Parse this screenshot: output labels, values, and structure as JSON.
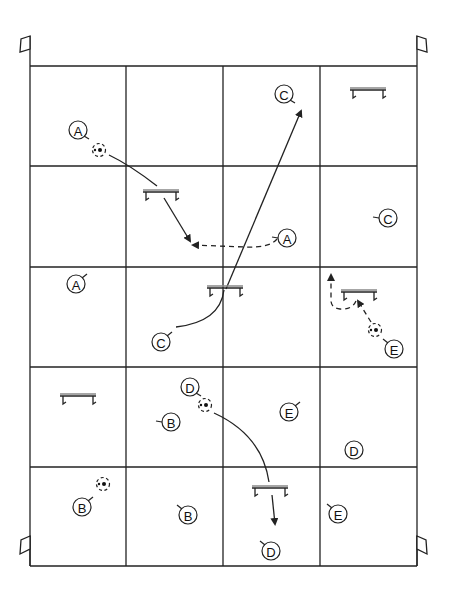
{
  "diagram": {
    "type": "soccer-drill-field",
    "grid": {
      "left": 30,
      "top": 66,
      "right": 417,
      "bottom": 566,
      "cols": [
        30,
        126,
        223,
        320,
        417
      ],
      "rows": [
        66,
        166,
        267,
        367,
        467,
        566
      ]
    },
    "colors": {
      "line": "#222222",
      "background": "#ffffff"
    },
    "flags": [
      {
        "id": "flag-top-left",
        "x": 30,
        "y": 66,
        "side": "left",
        "pos": "top"
      },
      {
        "id": "flag-top-right",
        "x": 417,
        "y": 66,
        "side": "right",
        "pos": "top"
      },
      {
        "id": "flag-bottom-left",
        "x": 30,
        "y": 566,
        "side": "left",
        "pos": "bottom"
      },
      {
        "id": "flag-bottom-right",
        "x": 417,
        "y": 566,
        "side": "right",
        "pos": "bottom"
      }
    ],
    "players": [
      {
        "label": "A",
        "x": 78,
        "y": 130,
        "tick": "se"
      },
      {
        "label": "A",
        "x": 287,
        "y": 238,
        "tick": "w"
      },
      {
        "label": "A",
        "x": 76,
        "y": 284,
        "tick": "ne"
      },
      {
        "label": "C",
        "x": 284,
        "y": 94,
        "tick": "se"
      },
      {
        "label": "C",
        "x": 388,
        "y": 218,
        "tick": "w"
      },
      {
        "label": "C",
        "x": 161,
        "y": 342,
        "tick": "ne"
      },
      {
        "label": "D",
        "x": 190,
        "y": 387,
        "tick": "se"
      },
      {
        "label": "D",
        "x": 354,
        "y": 450,
        "tick": "none"
      },
      {
        "label": "D",
        "x": 271,
        "y": 551,
        "tick": "nw"
      },
      {
        "label": "B",
        "x": 171,
        "y": 422,
        "tick": "w"
      },
      {
        "label": "B",
        "x": 82,
        "y": 507,
        "tick": "ne"
      },
      {
        "label": "B",
        "x": 188,
        "y": 515,
        "tick": "nw"
      },
      {
        "label": "E",
        "x": 289,
        "y": 412,
        "tick": "ne"
      },
      {
        "label": "E",
        "x": 394,
        "y": 349,
        "tick": "nw"
      },
      {
        "label": "E",
        "x": 338,
        "y": 514,
        "tick": "nw"
      }
    ],
    "balls": [
      {
        "x": 99,
        "y": 150
      },
      {
        "x": 375,
        "y": 330
      },
      {
        "x": 205,
        "y": 405
      },
      {
        "x": 103,
        "y": 484
      }
    ],
    "hurdles": [
      {
        "x": 161,
        "y": 192
      },
      {
        "x": 225,
        "y": 288
      },
      {
        "x": 368,
        "y": 90
      },
      {
        "x": 359,
        "y": 292
      },
      {
        "x": 78,
        "y": 396
      },
      {
        "x": 270,
        "y": 488
      }
    ],
    "paths": [
      {
        "id": "a-run",
        "style": "solid",
        "arrow": false,
        "d": "M 109 155 Q 130 165 157 186"
      },
      {
        "id": "a-hurdle-to-dash",
        "style": "solid",
        "arrow": true,
        "d": "M 164 198 L 190 241"
      },
      {
        "id": "a-dashed-pass",
        "style": "dashed",
        "arrow": true,
        "d": "M 277 239 Q 270 248 245 247 L 193 245"
      },
      {
        "id": "c-long-pass",
        "style": "solid",
        "arrow": true,
        "d": "M 226 289 L 301 111"
      },
      {
        "id": "c-curve",
        "style": "solid",
        "arrow": false,
        "d": "M 176 327 Q 220 322 224 290"
      },
      {
        "id": "e-dashed",
        "style": "dashed",
        "arrow": true,
        "d": "M 371 322 L 358 301"
      },
      {
        "id": "e-dashed-loop",
        "style": "dashed",
        "arrow": true,
        "d": "M 356 301 Q 352 310 340 309 Q 330 308 331 298 L 331 275"
      },
      {
        "id": "d-curve",
        "style": "solid",
        "arrow": false,
        "d": "M 214 413 Q 262 435 269 482"
      },
      {
        "id": "d-arrow",
        "style": "solid",
        "arrow": true,
        "d": "M 272 495 L 275 524"
      }
    ]
  }
}
